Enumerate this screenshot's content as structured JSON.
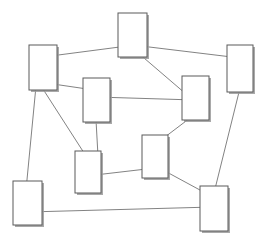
{
  "diagram": {
    "background_color": "#ffffff",
    "node_fill": "#ffffff",
    "node_stroke": "#5a5a5a",
    "node_shadow_color": "#9a9a9a",
    "edge_color": "#6b6b6b",
    "edge_width": 0.85,
    "node_count": 9,
    "edge_count": 11
  },
  "chart_data": {
    "type": "diagram",
    "nodes": [
      {
        "id": "n1",
        "label": "",
        "x": 29,
        "y": 45,
        "width": 28,
        "height": 45
      },
      {
        "id": "n2",
        "label": "",
        "x": 118,
        "y": 13,
        "width": 29,
        "height": 44
      },
      {
        "id": "n3",
        "label": "",
        "x": 227,
        "y": 45,
        "width": 26,
        "height": 47
      },
      {
        "id": "n4",
        "label": "",
        "x": 83,
        "y": 78,
        "width": 27,
        "height": 44
      },
      {
        "id": "n5",
        "label": "",
        "x": 182,
        "y": 76,
        "width": 27,
        "height": 44
      },
      {
        "id": "n6",
        "label": "",
        "x": 142,
        "y": 135,
        "width": 26,
        "height": 43
      },
      {
        "id": "n7",
        "label": "",
        "x": 75,
        "y": 151,
        "width": 26,
        "height": 42
      },
      {
        "id": "n8",
        "label": "",
        "x": 13,
        "y": 181,
        "width": 29,
        "height": 44
      },
      {
        "id": "n9",
        "label": "",
        "x": 200,
        "y": 186,
        "width": 28,
        "height": 45
      }
    ],
    "edges": [
      {
        "source": "n1",
        "target": "n2",
        "x1": 43,
        "y1": 57,
        "x2": 135,
        "y2": 45
      },
      {
        "source": "n2",
        "target": "n3",
        "x1": 141,
        "y1": 46,
        "x2": 240,
        "y2": 58
      },
      {
        "source": "n2",
        "target": "n5",
        "x1": 137,
        "y1": 52,
        "x2": 193,
        "y2": 100
      },
      {
        "source": "n1",
        "target": "n4",
        "x1": 53,
        "y1": 84,
        "x2": 94,
        "y2": 90
      },
      {
        "source": "n4",
        "target": "n5",
        "x1": 96,
        "y1": 97,
        "x2": 195,
        "y2": 100
      },
      {
        "source": "n1",
        "target": "n7",
        "x1": 41,
        "y1": 86,
        "x2": 86,
        "y2": 156
      },
      {
        "source": "n1",
        "target": "n8",
        "x1": 36,
        "y1": 86,
        "x2": 26,
        "y2": 190
      },
      {
        "source": "n4",
        "target": "n7",
        "x1": 96,
        "y1": 120,
        "x2": 98,
        "y2": 156
      },
      {
        "source": "n6",
        "target": "n7",
        "x1": 155,
        "y1": 168,
        "x2": 95,
        "y2": 175
      },
      {
        "source": "n5",
        "target": "n6",
        "x1": 190,
        "y1": 118,
        "x2": 165,
        "y2": 137
      },
      {
        "source": "n6",
        "target": "n9",
        "x1": 163,
        "y1": 170,
        "x2": 211,
        "y2": 196
      },
      {
        "source": "n3",
        "target": "n9",
        "x1": 240,
        "y1": 88,
        "x2": 213,
        "y2": 197
      },
      {
        "source": "n8",
        "target": "n9",
        "x1": 28,
        "y1": 212,
        "x2": 213,
        "y2": 207
      }
    ],
    "xlim": [
      0,
      269
    ],
    "ylim": [
      0,
      244
    ],
    "grid": false,
    "legend": null
  }
}
